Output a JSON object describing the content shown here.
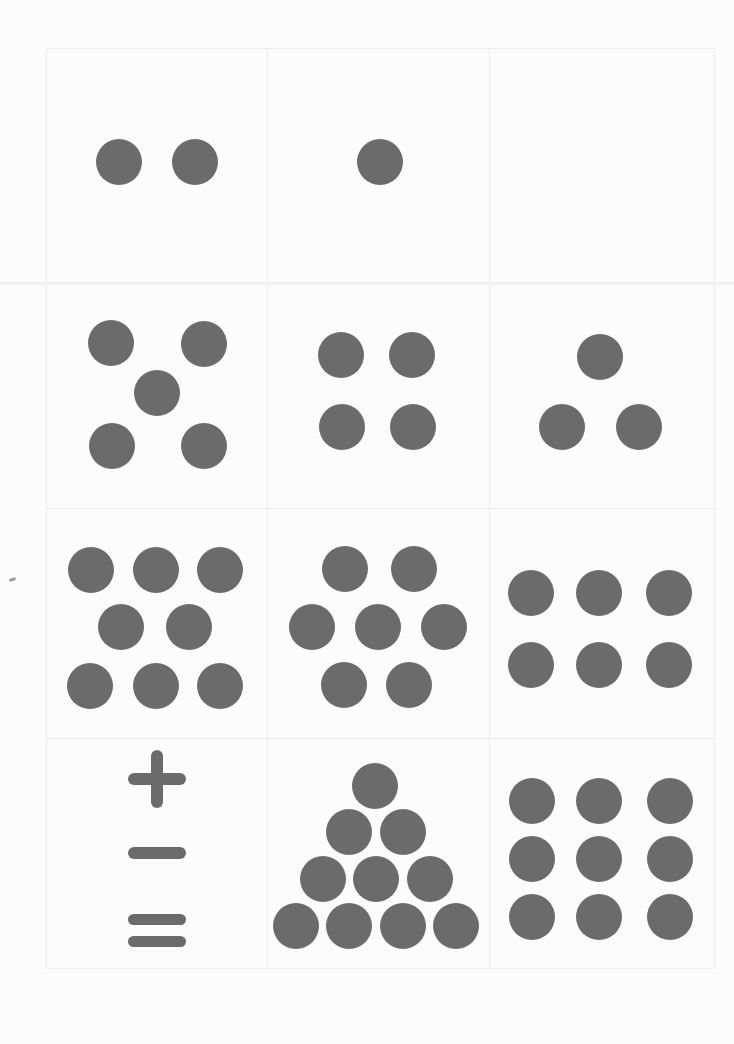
{
  "page": {
    "dot_color": "#6b6b6b",
    "background": "#fcfcfc",
    "grid_line_color": "#ececec"
  },
  "grid": {
    "columns": 3,
    "rows": 4,
    "bounds": {
      "left": 46,
      "top": 48,
      "right": 714,
      "bottom": 968
    },
    "col_edges": [
      46,
      267,
      489,
      714
    ],
    "row_edges": [
      48,
      283,
      508,
      738,
      968
    ]
  },
  "cards": [
    {
      "id": "r1c1",
      "label": "two dots",
      "count": 2,
      "dots": [
        [
          119,
          162
        ],
        [
          195,
          162
        ]
      ]
    },
    {
      "id": "r1c2",
      "label": "one dot",
      "count": 1,
      "dots": [
        [
          380,
          162
        ]
      ]
    },
    {
      "id": "r1c3",
      "label": "empty card",
      "count": 0,
      "dots": []
    },
    {
      "id": "r2c1",
      "label": "five dots dice pattern",
      "count": 5,
      "dots": [
        [
          111,
          343
        ],
        [
          204,
          344
        ],
        [
          157,
          393
        ],
        [
          112,
          446
        ],
        [
          204,
          446
        ]
      ]
    },
    {
      "id": "r2c2",
      "label": "four dots square",
      "count": 4,
      "dots": [
        [
          341,
          355
        ],
        [
          412,
          355
        ],
        [
          342,
          427
        ],
        [
          413,
          427
        ]
      ]
    },
    {
      "id": "r2c3",
      "label": "three dots triangle",
      "count": 3,
      "dots": [
        [
          600,
          357
        ],
        [
          562,
          427
        ],
        [
          639,
          427
        ]
      ]
    },
    {
      "id": "r3c1",
      "label": "eight dots",
      "count": 8,
      "dots": [
        [
          91,
          570
        ],
        [
          156,
          570
        ],
        [
          220,
          570
        ],
        [
          121,
          627
        ],
        [
          189,
          627
        ],
        [
          90,
          686
        ],
        [
          156,
          686
        ],
        [
          220,
          686
        ]
      ]
    },
    {
      "id": "r3c2",
      "label": "seven dots hexagon",
      "count": 7,
      "dots": [
        [
          345,
          569
        ],
        [
          414,
          569
        ],
        [
          312,
          627
        ],
        [
          378,
          627
        ],
        [
          444,
          627
        ],
        [
          344,
          685
        ],
        [
          409,
          685
        ]
      ]
    },
    {
      "id": "r3c3",
      "label": "six dots grid",
      "count": 6,
      "dots": [
        [
          531,
          593
        ],
        [
          599,
          593
        ],
        [
          669,
          593
        ],
        [
          531,
          665
        ],
        [
          599,
          665
        ],
        [
          669,
          665
        ]
      ]
    },
    {
      "id": "r4c1",
      "label": "math symbols",
      "count": 0,
      "symbols": [
        "plus",
        "minus",
        "equals"
      ]
    },
    {
      "id": "r4c2",
      "label": "ten dots triangle",
      "count": 10,
      "dots": [
        [
          375,
          786
        ],
        [
          349,
          832
        ],
        [
          403,
          832
        ],
        [
          323,
          879
        ],
        [
          376,
          879
        ],
        [
          430,
          879
        ],
        [
          296,
          926
        ],
        [
          349,
          926
        ],
        [
          403,
          926
        ],
        [
          456,
          926
        ]
      ]
    },
    {
      "id": "r4c3",
      "label": "nine dots grid",
      "count": 9,
      "dots": [
        [
          532,
          801
        ],
        [
          599,
          801
        ],
        [
          670,
          801
        ],
        [
          532,
          859
        ],
        [
          599,
          859
        ],
        [
          670,
          859
        ],
        [
          532,
          917
        ],
        [
          599,
          917
        ],
        [
          670,
          917
        ]
      ]
    }
  ],
  "symbols": {
    "plus": {
      "cx": 157,
      "cy": 779
    },
    "minus": {
      "cx": 157,
      "cy": 853
    },
    "equals": {
      "cx": 157,
      "cy": 917
    }
  }
}
